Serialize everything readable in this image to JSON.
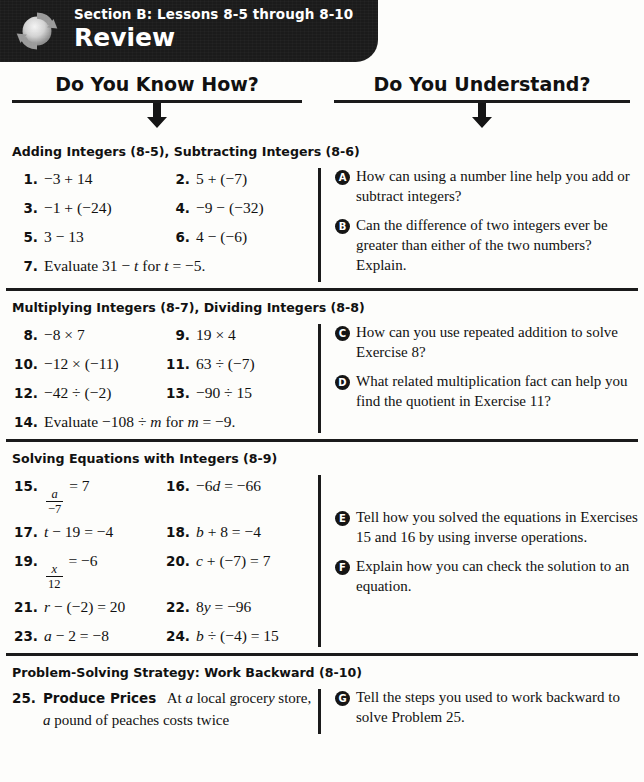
{
  "banner": {
    "eyebrow": "Section B: Lessons 8-5 through 8-10",
    "title": "Review",
    "icon": "review-circular-arrows-icon",
    "bg_color": "#1b1b1b",
    "text_color": "#ffffff"
  },
  "columns": {
    "left_heading": "Do You Know How?",
    "right_heading": "Do You Understand?"
  },
  "sections": [
    {
      "title": "Adding Integers (8-5), Subtracting Integers (8-6)",
      "exercises": [
        {
          "num": "1.",
          "body": "−3 + 14"
        },
        {
          "num": "2.",
          "body": "5 + (−7)"
        },
        {
          "num": "3.",
          "body": "−1 + (−24)"
        },
        {
          "num": "4.",
          "body": "−9 − (−32)"
        },
        {
          "num": "5.",
          "body": "3 − 13"
        },
        {
          "num": "6.",
          "body": "4 − (−6)"
        }
      ],
      "wide_exercise": {
        "num": "7.",
        "body": "Evaluate 31 − t for t = −5."
      },
      "questions": [
        {
          "badge": "A",
          "text": "How can using a number line help you add or subtract integers?"
        },
        {
          "badge": "B",
          "text": "Can the difference of two integers ever be greater than either of the two numbers? Explain."
        }
      ]
    },
    {
      "title": "Multiplying Integers (8-7), Dividing Integers (8-8)",
      "exercises": [
        {
          "num": "8.",
          "body": "−8 × 7"
        },
        {
          "num": "9.",
          "body": "19 × 4"
        },
        {
          "num": "10.",
          "body": "−12 × (−11)"
        },
        {
          "num": "11.",
          "body": "63 ÷ (−7)"
        },
        {
          "num": "12.",
          "body": "−42 ÷ (−2)"
        },
        {
          "num": "13.",
          "body": "−90 ÷ 15"
        }
      ],
      "wide_exercise": {
        "num": "14.",
        "body": "Evaluate −108 ÷ m for m = −9."
      },
      "questions": [
        {
          "badge": "C",
          "text": "How can you use repeated addition to solve Exercise 8?"
        },
        {
          "badge": "D",
          "text": "What related multiplication fact can help you find the quotient in Exercise 11?"
        }
      ]
    },
    {
      "title": "Solving Equations with Integers (8-9)",
      "exercises": [
        {
          "num": "15.",
          "frac": {
            "numerator": "a",
            "denominator": "−7"
          },
          "body_after": "= 7"
        },
        {
          "num": "16.",
          "body": "−6d = −66"
        },
        {
          "num": "17.",
          "body": "t − 19 = −4"
        },
        {
          "num": "18.",
          "body": "b + 8 = −4"
        },
        {
          "num": "19.",
          "frac": {
            "numerator": "x",
            "denominator": "12"
          },
          "body_after": "= −6"
        },
        {
          "num": "20.",
          "body": "c + (−7) = 7"
        },
        {
          "num": "21.",
          "body": "r − (−2) = 20"
        },
        {
          "num": "22.",
          "body": "8y = −96"
        },
        {
          "num": "23.",
          "body": "a − 2 = −8"
        },
        {
          "num": "24.",
          "body": "b ÷ (−4) = 15"
        }
      ],
      "questions": [
        {
          "badge": "E",
          "text": "Tell how you solved the equations in Exercises 15 and 16 by using inverse operations."
        },
        {
          "badge": "F",
          "text": "Explain how you can check the solution to an equation."
        }
      ]
    },
    {
      "title": "Problem-Solving Strategy: Work Backward (8-10)",
      "problem": {
        "num": "25.",
        "lead": "Produce Prices",
        "text": "At a local grocery store, a pound of peaches costs twice"
      },
      "questions": [
        {
          "badge": "G",
          "text": "Tell the steps you used to work backward to solve Problem 25."
        }
      ]
    }
  ]
}
